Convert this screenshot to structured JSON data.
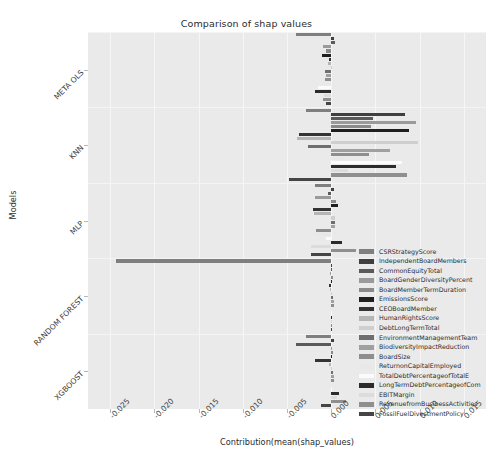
{
  "chart": {
    "title": "Comparison of shap values",
    "xlabel": "Contribution(mean(shap_values)",
    "ylabel": "Models"
  },
  "chart_data": {
    "type": "bar",
    "orientation": "horizontal",
    "title": "Comparison of shap values",
    "xlabel": "Contribution(mean(shap_values)",
    "ylabel": "Models",
    "grid": true,
    "legend_position": "center right",
    "xlim": [
      -0.0275,
      0.0175
    ],
    "xticks": [
      -0.025,
      -0.02,
      -0.015,
      -0.01,
      -0.005,
      0.0,
      0.005,
      0.01,
      0.015
    ],
    "xtick_labels": [
      "-0.025",
      "-0.020",
      "-0.015",
      "-0.010",
      "-0.005",
      "0.000",
      "0.005",
      "0.010",
      "0.015"
    ],
    "categories": [
      "META OLS",
      "KNN",
      "MLP",
      "RANDOM FOREST",
      "XGBOOST"
    ],
    "series": [
      {
        "name": "CSRStrategyScore",
        "color": "#7f7f7f",
        "values": [
          -0.004,
          -0.00285,
          -0.0018,
          -0.0243,
          -0.00285
        ]
      },
      {
        "name": "IndependentBoardMembers",
        "color": "#3f3f3f",
        "values": [
          0.0003,
          0.0083,
          0.00035,
          0.0,
          0.00035
        ]
      },
      {
        "name": "CommonEquityTotal",
        "color": "#5a5a5a",
        "values": [
          0.0004,
          0.0047,
          -0.0004,
          0.0,
          -0.004
        ]
      },
      {
        "name": "BoardGenderDiversityPercent",
        "color": "#9a9a9a",
        "values": [
          -0.00095,
          0.00955,
          -0.00185,
          -0.00012,
          0.00012
        ]
      },
      {
        "name": "BoardMemberTermDuration",
        "color": "#8a8a8a",
        "values": [
          -0.00055,
          0.0045,
          0.00055,
          0.00022,
          0.00022
        ]
      },
      {
        "name": "EmissionsScore",
        "color": "#1f1f1f",
        "values": [
          -0.001,
          0.00885,
          0.00075,
          0.0,
          0.0
        ]
      },
      {
        "name": "CEOBoardMember",
        "color": "#333333",
        "values": [
          -0.0002,
          -0.0036,
          -0.00205,
          -0.0003,
          -0.0018
        ]
      },
      {
        "name": "HumanRightsScore",
        "color": "#b5b5b5",
        "values": [
          -0.0004,
          -0.0039,
          -0.002,
          -0.0001,
          -0.0003
        ]
      },
      {
        "name": "DebtLongTermTotal",
        "color": "#cfcfcf",
        "values": [
          0.0,
          0.0098,
          0.00045,
          0.0,
          0.0
        ]
      },
      {
        "name": "EnvironmentManagementTeam",
        "color": "#6e6e6e",
        "values": [
          -0.00075,
          -0.0026,
          0.00045,
          0.00025,
          0.00025
        ]
      },
      {
        "name": "BiodiversityImpactReduction",
        "color": "#a0a0a0",
        "values": [
          -0.00055,
          0.0067,
          0.00045,
          0.00028,
          0.00028
        ]
      },
      {
        "name": "BoardSize",
        "color": "#8e8e8e",
        "values": [
          -0.00065,
          0.0043,
          -0.00175,
          0.00033,
          0.00033
        ]
      },
      {
        "name": "ReturnonCapitalEmployed",
        "color": "#e8e8e8",
        "values": [
          -0.00018,
          0.00135,
          -0.00185,
          -5e-05,
          -5e-05
        ]
      },
      {
        "name": "TotalDebtPercentageofTotalE",
        "color": "#fbfbfb",
        "values": [
          -0.0015,
          0.00795,
          -0.00055,
          0.0,
          0.0
        ]
      },
      {
        "name": "LongTermDebtPercentageofCom",
        "color": "#2b2b2b",
        "values": [
          -0.00185,
          0.00735,
          0.00125,
          0.0,
          0.00085
        ]
      },
      {
        "name": "EBITMargin",
        "color": "#dcdcdc",
        "values": [
          -0.0008,
          0.0019,
          -0.0023,
          0.0,
          0.0006
        ]
      },
      {
        "name": "RevenuefromBusinessActivities",
        "color": "#8f8f8f",
        "values": [
          -0.0009,
          0.00855,
          0.00275,
          0.0,
          0.00165
        ]
      },
      {
        "name": "FossilFuelDivestmentPolicy",
        "color": "#454545",
        "values": [
          -0.0006,
          -0.00475,
          -0.00225,
          0.0,
          -0.0012
        ]
      }
    ]
  }
}
